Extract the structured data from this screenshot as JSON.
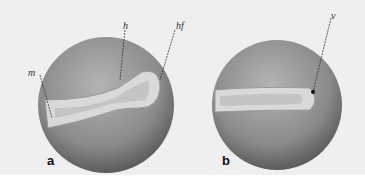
{
  "figure": {
    "panels": [
      {
        "id": "a",
        "label": "a",
        "annotations": [
          {
            "id": "m",
            "text": "m"
          },
          {
            "id": "h",
            "text": "h"
          },
          {
            "id": "hf",
            "text": "hf"
          }
        ]
      },
      {
        "id": "b",
        "label": "b",
        "annotations": [
          {
            "id": "v",
            "text": "v"
          }
        ]
      }
    ],
    "colors": {
      "background": "#efefef",
      "sphere": "#8f8f8f",
      "embryo": "#d6d6d6"
    }
  }
}
